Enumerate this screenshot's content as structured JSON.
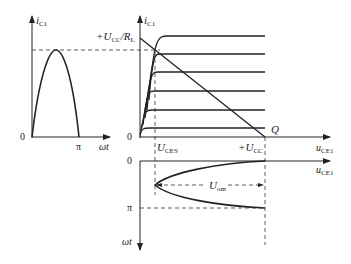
{
  "left_panel": {
    "y_axis_label": "i",
    "y_axis_sub": "C1",
    "x_axis_label": "ωt",
    "origin_label": "0",
    "pi_label": "π"
  },
  "main_panel": {
    "y_axis_label": "i",
    "y_axis_sub": "C1",
    "x_axis_label": "u",
    "x_axis_sub": "CE1",
    "origin_label": "0",
    "top_label_prefix": "+U",
    "top_label_sub1": "CC",
    "top_label_mid": "/R",
    "top_label_sub2": "L",
    "q_label": "Q",
    "uces_label": "U",
    "uces_sub": "CES",
    "ucc_label": "+U",
    "ucc_sub": "CC"
  },
  "bottom_panel": {
    "x_axis_label": "u",
    "x_axis_sub": "CE1",
    "y_axis_label": "ωt",
    "origin_label": "0",
    "pi_label": "π",
    "uom_label": "U",
    "uom_sub": "om"
  },
  "colors": {
    "line": "#222222",
    "dash": "#333333"
  }
}
